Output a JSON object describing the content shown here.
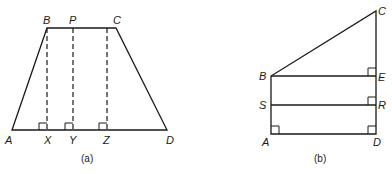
{
  "figures": [
    {
      "id": "a",
      "caption": "(a)",
      "shape": "trapezium",
      "labels": {
        "A": "A",
        "B": "B",
        "C": "C",
        "D": "D",
        "P": "P",
        "X": "X",
        "Y": "Y",
        "Z": "Z"
      },
      "segments": [
        "AB",
        "BC",
        "CD",
        "AD"
      ],
      "dashed_perpendiculars": [
        "BX",
        "PY",
        "CZ"
      ],
      "right_angles": [
        "X",
        "Y",
        "Z"
      ]
    },
    {
      "id": "b",
      "caption": "(b)",
      "shape": "right trapezium",
      "labels": {
        "A": "A",
        "B": "B",
        "C": "C",
        "D": "D",
        "E": "E",
        "R": "R",
        "S": "S"
      },
      "segments": [
        "AB",
        "BC",
        "CD",
        "AD",
        "BE",
        "SR"
      ],
      "right_angles": [
        "A",
        "D",
        "E",
        "R"
      ]
    }
  ]
}
